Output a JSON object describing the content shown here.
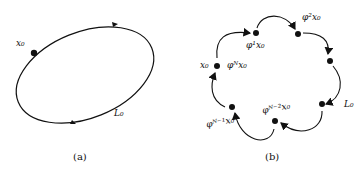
{
  "figure": {
    "panel_a": {
      "caption": "(a)",
      "labels": {
        "start_point": "x₀",
        "orbit": "L₀"
      }
    },
    "panel_b": {
      "caption": "(b)",
      "labels": {
        "start_point": "x₀",
        "phi_N": "φᴺx₀",
        "phi_1": "φ¹x₀",
        "phi_2": "φ²x₀",
        "orbit": "L₀",
        "phi_N_minus_2": "φᴺ⁻²x₀",
        "phi_N_minus_1": "φᴺ⁻¹x₀"
      }
    }
  }
}
